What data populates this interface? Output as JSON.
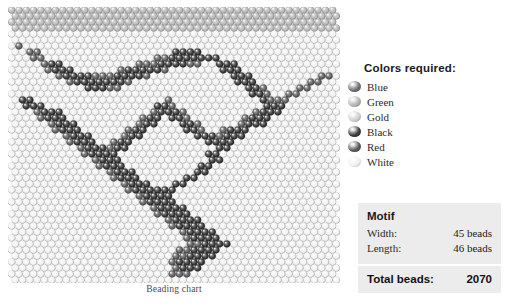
{
  "caption": "Beading chart",
  "colors": {
    "title": "Colors required:",
    "items": [
      {
        "label": "Blue",
        "hex": "#6e6e6e"
      },
      {
        "label": "Green",
        "hex": "#b3b3b3"
      },
      {
        "label": "Gold",
        "hex": "#cfcfcf"
      },
      {
        "label": "Black",
        "hex": "#3a3a3a"
      },
      {
        "label": "Red",
        "hex": "#5a5a5a"
      },
      {
        "label": "White",
        "hex": "#f2f2f2"
      }
    ]
  },
  "motif": {
    "title": "Motif",
    "width_label": "Width:",
    "width_value": "45 beads",
    "length_label": "Length:",
    "length_value": "46 beads",
    "total_label": "Total beads:",
    "total_value": "2070"
  },
  "chart_data": {
    "type": "heatmap",
    "title": "Beading chart",
    "xlabel": "",
    "ylabel": "",
    "columns": 45,
    "rows": 46,
    "total_beads": 2070,
    "stitch": "brick-offset",
    "palette": {
      "0": "#f4f4f4",
      "1": "#b9b9b9",
      "2": "#8c8c8c",
      "3": "#5a5a5a",
      "4": "#323232"
    },
    "grid": [
      "111111111111111111111111111111111111111111111",
      "111111111111111111111111111111111111111111111",
      "111111111111111111111111111111111111111111111",
      "111111111111111111111111111111111111111111111",
      "000000000000000000000000000000000000000000000",
      "000000000000000000000000000000000000000000000",
      "030000000000000000000000000000000000000000000",
      "003300000000000000000044440000000000000000000",
      "000330000000000000003344444440000000000000000",
      "000034400000000003334444330044400000000000000",
      "000003444000000344444300000004440000000000000",
      "000000344443334444300000000000444000000000330",
      "000000003444444430000000000000044400000003300",
      "000000000044433000000000000000004430000330000",
      "000000000000000000000000000000000443003300000",
      "044000000000000000000300000000000043330000000",
      "004440000000000000004430000000000004440000000",
      "000344400000000000034443000000000344400000000",
      "000034440000000000344044300000003444000000000",
      "000003444000000003440004430000034440000000000",
      "000000344400000034400000443003444000000000000",
      "000000034440000344000000044434440000000000000",
      "000000003444003440000000000444400000000000000",
      "000000000344434400000000000044000000000000000",
      "000000000034444000000000000440000000000000000",
      "000000000003444000000000000440000000000000000",
      "000000000000344400000000004400000000000000000",
      "000000000000034440000000044000000000000000000",
      "000000000000003444000000440000000000000000000",
      "000000000000000344400044000000000000000000000",
      "000000000000000034444440000000000000000000000",
      "000000000000000003444400000000000000000000000",
      "000000000000000000344440000000000000000000000",
      "000000000000000000034444000000000000000000000",
      "000000000000000000003444400000000000000000000",
      "000000000000000000000344440000000000000000000",
      "000000000000000000000034444000000000000000000",
      "000000000000000000000003444400000000000000000",
      "000000000000000000000000344440000000000000000",
      "000000000000000000000000334444000000000000000",
      "000000000000000000000003344440000000000000000",
      "000000000000000000000033444400000000000000000",
      "000000000000000000000034444000000000000000000",
      "000000000000000000000034440000000000000000000",
      "000000000000000000000033300000000000000000000",
      "000000000000000000000000000000000000000000000"
    ]
  }
}
